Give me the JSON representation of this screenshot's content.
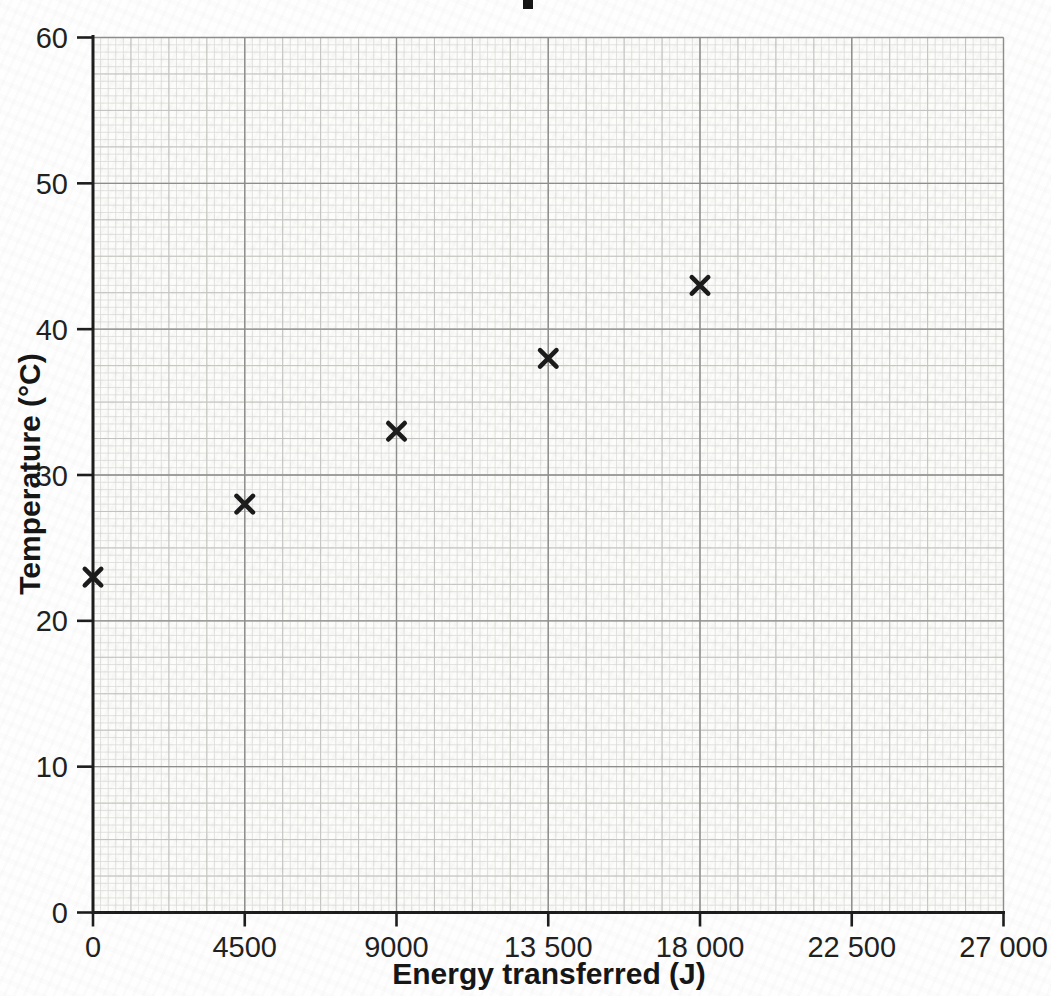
{
  "chart_data": {
    "type": "scatter",
    "title": "",
    "xlabel": "Energy transferred (J)",
    "ylabel": "Temperature (°C)",
    "xlim": [
      0,
      27000
    ],
    "ylim": [
      0,
      60
    ],
    "x_ticks": [
      0,
      4500,
      9000,
      13500,
      18000,
      22500,
      27000
    ],
    "x_tick_labels": [
      "0",
      "4500",
      "9000",
      "13 500",
      "18 000",
      "22 500",
      "27 000"
    ],
    "y_ticks": [
      0,
      10,
      20,
      30,
      40,
      50,
      60
    ],
    "y_tick_labels": [
      "0",
      "10",
      "20",
      "30",
      "40",
      "50",
      "60"
    ],
    "points": [
      {
        "x": 0,
        "y": 23
      },
      {
        "x": 4500,
        "y": 28
      },
      {
        "x": 9000,
        "y": 33
      },
      {
        "x": 13500,
        "y": 38
      },
      {
        "x": 18000,
        "y": 43
      }
    ],
    "marker": "x",
    "grid": "graph-paper",
    "grid_steps": {
      "x_minor": 225,
      "x_medium": 1125,
      "x_major": 4500,
      "y_minor": 0.5,
      "y_medium": 2.5,
      "y_major": 10
    },
    "legend": null,
    "colors": {
      "paper": "#fcfcfa",
      "grid_minor": "#dbdbd9",
      "grid_medium": "#c3c3c1",
      "grid_major": "#8d8d8b",
      "axis": "#1c1c1c",
      "marker": "#1a1a1a",
      "tick_label": "#1f1f1f"
    }
  }
}
